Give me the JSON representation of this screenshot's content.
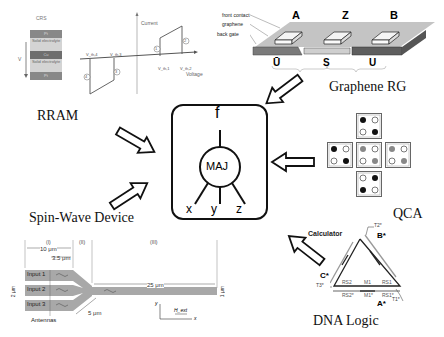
{
  "center": {
    "output_label": "f",
    "gate_label": "MAJ",
    "inputs": [
      "x",
      "y",
      "z"
    ]
  },
  "titles": {
    "rram": "RRAM",
    "graphene": "Graphene RG",
    "qca": "QCA",
    "spin_wave": "Spin-Wave Device",
    "dna": "DNA Logic"
  },
  "rram": {
    "crs_title": "CRS",
    "layers": [
      "Pt",
      "Solid electrolyte",
      "Cu",
      "Solid electrolyte",
      "Pt"
    ],
    "voltage_arrow_label": "V",
    "axis_y": "Current",
    "axis_x": "Voltage",
    "thresholds": [
      "V_th,4",
      "V_th,3",
      "V_th,1",
      "V_th,2"
    ],
    "markers": [
      "1",
      "2",
      "3",
      "4"
    ]
  },
  "graphene": {
    "labels": [
      "front contact",
      "graphene",
      "back gate"
    ],
    "contacts": [
      "A",
      "Z",
      "B"
    ],
    "regions": [
      "Ū",
      "S",
      "U"
    ]
  },
  "qca": {
    "cells": [
      {
        "pos": "top",
        "dots": [
          "black",
          "white",
          "white",
          "black"
        ]
      },
      {
        "pos": "left",
        "dots": [
          "black",
          "white",
          "white",
          "black"
        ]
      },
      {
        "pos": "center",
        "dots": [
          "gray",
          "white",
          "white",
          "gray"
        ]
      },
      {
        "pos": "right",
        "dots": [
          "gray",
          "white",
          "white",
          "gray"
        ]
      },
      {
        "pos": "bottom",
        "dots": [
          "white",
          "black",
          "black",
          "white"
        ]
      }
    ]
  },
  "spin_wave": {
    "sections": [
      "(I)",
      "(II)",
      "(III)"
    ],
    "dim_10": "10 μm",
    "dim_3_5": "3.5 μm",
    "dim_25": "25 μm",
    "dim_5": "5 μm",
    "dim_2": "2 μm",
    "dim_1": "1 μm",
    "inputs": [
      "Input 1",
      "Input 2",
      "Input 3"
    ],
    "antennas": "Antennas",
    "axis_y": "y",
    "axis_x": "x",
    "field": "H_ext"
  },
  "dna": {
    "title": "Calculator",
    "vertices": [
      "A*",
      "B*",
      "C*"
    ],
    "toeholds": [
      "T1*",
      "T2*",
      "T3*"
    ],
    "bottom_inner": [
      "RS2",
      "M1",
      "RS1"
    ],
    "bottom_outer": [
      "RS2*",
      "M1*",
      "RS1*"
    ]
  }
}
